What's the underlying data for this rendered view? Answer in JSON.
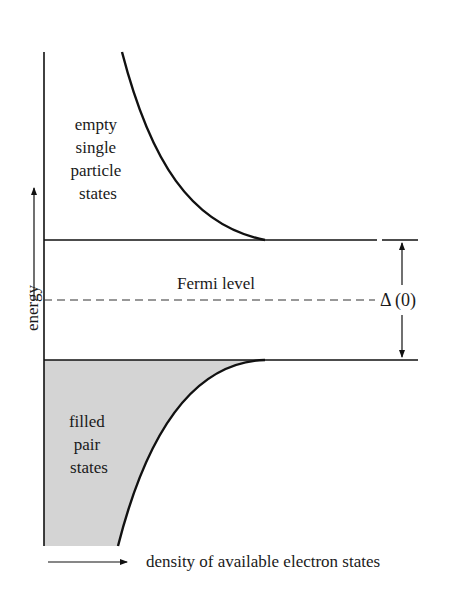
{
  "diagram": {
    "type": "energy-gap density-of-states diagram",
    "colors": {
      "line": "#111111",
      "fill_filled_states": "#d4d4d4",
      "text": "#1a1a1a",
      "background": "#ffffff"
    },
    "regions": {
      "upper_label_lines": [
        "empty",
        "single",
        "particle",
        "states"
      ],
      "lower_label_lines": [
        "filled",
        "pair",
        "states"
      ]
    },
    "fermi_level_label": "Fermi level",
    "gap_label": "Δ (0)",
    "y_axis_label": "energy",
    "x_axis_label": "density of available electron states"
  }
}
